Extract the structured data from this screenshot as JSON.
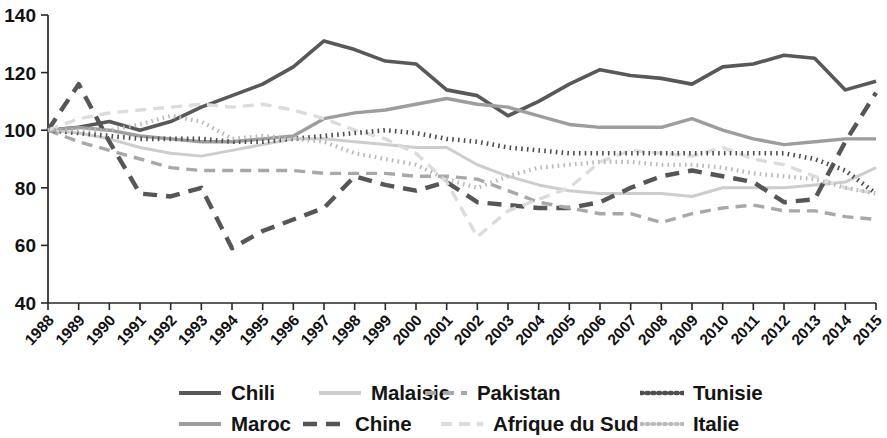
{
  "chart_data": {
    "type": "line",
    "title": "",
    "subtitle": "",
    "xlabel": "",
    "ylabel": "",
    "xlim": [
      1988,
      2015
    ],
    "ylim": [
      40,
      140
    ],
    "yticks": [
      40,
      60,
      80,
      100,
      120,
      140
    ],
    "ytick_labels": [
      "40",
      "60",
      "80",
      "100",
      "120",
      "140"
    ],
    "grid": false,
    "legend_position": "bottom",
    "x": [
      1988,
      1989,
      1990,
      1991,
      1992,
      1993,
      1994,
      1995,
      1996,
      1997,
      1998,
      1999,
      2000,
      2001,
      2002,
      2003,
      2004,
      2005,
      2006,
      2007,
      2008,
      2009,
      2010,
      2011,
      2012,
      2013,
      2014,
      2015
    ],
    "categories": [
      "1988",
      "1989",
      "1990",
      "1991",
      "1992",
      "1993",
      "1994",
      "1995",
      "1996",
      "1997",
      "1998",
      "1999",
      "2000",
      "2001",
      "2002",
      "2003",
      "2004",
      "2005",
      "2006",
      "2007",
      "2008",
      "2009",
      "2010",
      "2011",
      "2012",
      "2013",
      "2014",
      "2015"
    ],
    "series": [
      {
        "name": "Chili",
        "color": "#58585a",
        "style": "solid",
        "width": 3.6,
        "values": [
          100,
          101,
          103,
          100,
          103,
          108,
          112,
          116,
          122,
          131,
          128,
          124,
          123,
          114,
          112,
          105,
          110,
          116,
          121,
          119,
          118,
          116,
          122,
          123,
          126,
          125,
          114,
          117
        ]
      },
      {
        "name": "Maroc",
        "color": "#9d9d9f",
        "style": "solid",
        "width": 3.4,
        "values": [
          100,
          101,
          100,
          98,
          97,
          96,
          96,
          97,
          98,
          104,
          106,
          107,
          109,
          111,
          109,
          108,
          105,
          102,
          101,
          101,
          101,
          104,
          100,
          97,
          95,
          96,
          97,
          97
        ]
      },
      {
        "name": "Malaisie",
        "color": "#cdcdcf",
        "style": "solid",
        "width": 3.0,
        "values": [
          100,
          99,
          97,
          94,
          92,
          91,
          93,
          95,
          97,
          97,
          96,
          95,
          94,
          94,
          88,
          84,
          81,
          79,
          78,
          78,
          78,
          77,
          80,
          80,
          80,
          81,
          82,
          87
        ]
      },
      {
        "name": "Chine",
        "color": "#565658",
        "style": "dashed-long",
        "width": 4.4,
        "dash": "14 9",
        "values": [
          100,
          116,
          96,
          78,
          77,
          80,
          59,
          65,
          69,
          73,
          84,
          81,
          79,
          82,
          75,
          74,
          73,
          73,
          75,
          80,
          84,
          86,
          84,
          82,
          75,
          76,
          96,
          113
        ]
      },
      {
        "name": "Pakistan",
        "color": "#a8a8aa",
        "style": "dashed",
        "width": 3.4,
        "dash": "11 7",
        "values": [
          100,
          96,
          93,
          90,
          87,
          86,
          86,
          86,
          86,
          85,
          85,
          85,
          84,
          84,
          83,
          79,
          75,
          73,
          71,
          71,
          68,
          71,
          73,
          74,
          72,
          72,
          70,
          69
        ]
      },
      {
        "name": "Afrique du Sud",
        "color": "#dcdcde",
        "style": "dashed",
        "width": 3.4,
        "dash": "11 7",
        "values": [
          100,
          104,
          106,
          107,
          108,
          109,
          108,
          109,
          107,
          104,
          100,
          97,
          92,
          82,
          63,
          72,
          76,
          80,
          89,
          93,
          92,
          91,
          94,
          90,
          88,
          84,
          80,
          78
        ]
      },
      {
        "name": "Tunisie",
        "color": "#4e4e50",
        "style": "dotted",
        "width": 4.6,
        "dash": "1.6 4.2",
        "values": [
          100,
          99,
          98,
          97,
          97,
          97,
          96,
          96,
          97,
          98,
          99,
          100,
          99,
          97,
          96,
          94,
          93,
          92,
          92,
          92,
          92,
          92,
          92,
          92,
          92,
          90,
          86,
          78
        ]
      },
      {
        "name": "Italie",
        "color": "#b9b9bb",
        "style": "dotted",
        "width": 4.2,
        "dash": "1.6 4.2",
        "values": [
          100,
          100,
          100,
          102,
          105,
          103,
          97,
          98,
          97,
          96,
          92,
          90,
          88,
          83,
          80,
          84,
          87,
          88,
          89,
          89,
          88,
          88,
          87,
          85,
          84,
          83,
          80,
          78
        ]
      }
    ]
  },
  "legend": {
    "rows": [
      [
        {
          "label": "Chili",
          "series": 0
        },
        {
          "label": "Malaisie",
          "series": 2
        },
        {
          "label": "Pakistan",
          "series": 4
        },
        {
          "label": "Tunisie",
          "series": 6
        }
      ],
      [
        {
          "label": "Maroc",
          "series": 1
        },
        {
          "label": "Chine",
          "series": 3
        },
        {
          "label": "Afrique du Sud",
          "series": 5
        },
        {
          "label": "Italie",
          "series": 7
        }
      ]
    ]
  },
  "layout": {
    "plot_left": 48,
    "plot_right": 876,
    "plot_top": 15,
    "plot_bottom": 303
  }
}
